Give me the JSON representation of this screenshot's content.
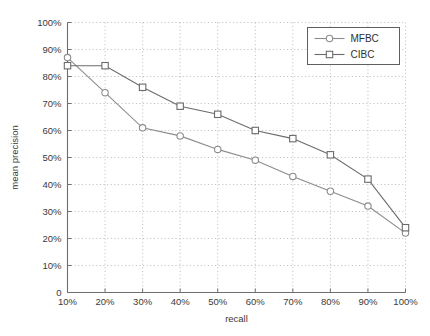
{
  "chart_data": {
    "type": "line",
    "title": "",
    "xlabel": "recall",
    "ylabel": "mean precision",
    "x": [
      10,
      20,
      30,
      40,
      50,
      60,
      70,
      80,
      90,
      100
    ],
    "xtick_labels": [
      "10%",
      "20%",
      "30%",
      "40%",
      "50%",
      "60%",
      "70%",
      "80%",
      "90%",
      "100%"
    ],
    "ytick_labels": [
      "0",
      "10%",
      "20%",
      "30%",
      "40%",
      "50%",
      "60%",
      "70%",
      "80%",
      "90%",
      "100%"
    ],
    "ytick_values": [
      0,
      10,
      20,
      30,
      40,
      50,
      60,
      70,
      80,
      90,
      100
    ],
    "xlim": [
      10,
      100
    ],
    "ylim": [
      0,
      100
    ],
    "grid": true,
    "grid_style": "dotted",
    "legend_position": "top-right",
    "series": [
      {
        "name": "MFBC",
        "marker": "circle",
        "color": "#8c8c8c",
        "values": [
          87,
          74,
          61,
          58,
          53,
          49,
          43,
          37.5,
          32,
          22
        ]
      },
      {
        "name": "CIBC",
        "marker": "square",
        "color": "#6b6b6b",
        "values": [
          84,
          84,
          76,
          69,
          66,
          60,
          57,
          51,
          42,
          24
        ]
      }
    ]
  },
  "legend": {
    "entries": [
      {
        "label": "MFBC"
      },
      {
        "label": "CIBC"
      }
    ]
  },
  "colors": {
    "background": "#ffffff",
    "axis": "#6e6e6e",
    "grid": "#a8a8a8",
    "text": "#3a3a3a",
    "series_mfbc": "#8c8c8c",
    "series_cibc": "#6b6b6b"
  }
}
